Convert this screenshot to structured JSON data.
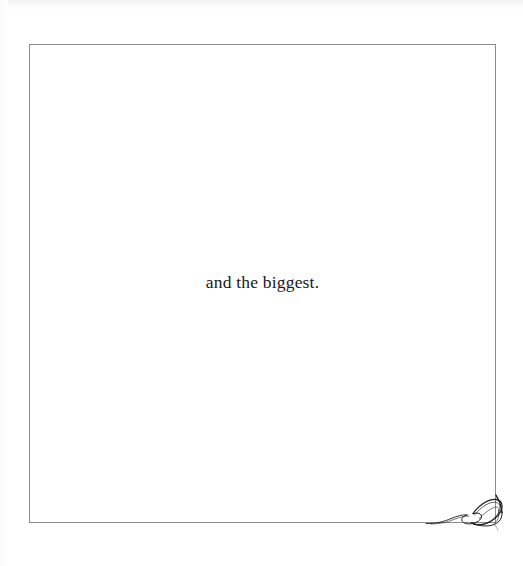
{
  "page": {
    "background_color": "#ffffff",
    "width": 523,
    "height": 566
  },
  "frame": {
    "border_color": "#8c8c8c",
    "border_width": "1px",
    "left": 29,
    "top": 44,
    "width": 467,
    "height": 479
  },
  "content": {
    "caption": "and the biggest.",
    "caption_color": "#17171a",
    "caption_align": "center"
  },
  "ornament": {
    "name": "corner-flourish",
    "description": "calligraphic double-loop swirl",
    "position": "bottom-right",
    "stroke_color": "#1b1b1f"
  }
}
